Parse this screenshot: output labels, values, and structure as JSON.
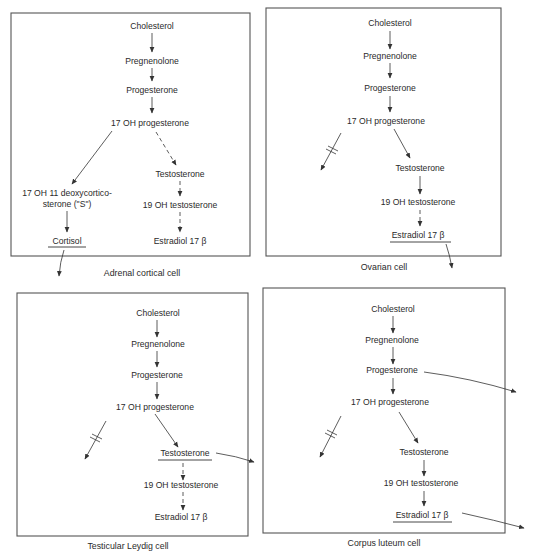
{
  "figure": {
    "panels": [
      {
        "caption": "Adrenal cortical cell",
        "nodes": {
          "cholesterol": "Cholesterol",
          "pregnenolone": "Pregnenolone",
          "progesterone": "Progesterone",
          "oh17_progesterone": "17 OH progesterone",
          "deoxy_line1": "17 OH 11 deoxycortico-",
          "deoxy_line2": "sterone (\"S\")",
          "cortisol": "Cortisol",
          "testosterone": "Testosterone",
          "oh19_testosterone": "19 OH testosterone",
          "estradiol": "Estradiol 17 β"
        },
        "secreted_product": "Cortisol",
        "blocked_branch": false
      },
      {
        "caption": "Ovarian cell",
        "nodes": {
          "cholesterol": "Cholesterol",
          "pregnenolone": "Pregnenolone",
          "progesterone": "Progesterone",
          "oh17_progesterone": "17 OH progesterone",
          "testosterone": "Testosterone",
          "oh19_testosterone": "19 OH testosterone",
          "estradiol": "Estradiol 17 β"
        },
        "secreted_product": "Estradiol 17 β",
        "blocked_branch": true
      },
      {
        "caption": "Testicular Leydig cell",
        "nodes": {
          "cholesterol": "Cholesterol",
          "pregnenolone": "Pregnenolone",
          "progesterone": "Progesterone",
          "oh17_progesterone": "17 OH progesterone",
          "testosterone": "Testosterone",
          "oh19_testosterone": "19 OH testosterone",
          "estradiol": "Estradiol 17 β"
        },
        "secreted_product": "Testosterone",
        "blocked_branch": true
      },
      {
        "caption": "Corpus luteum cell",
        "nodes": {
          "cholesterol": "Cholesterol",
          "pregnenolone": "Pregnenolone",
          "progesterone": "Progesterone",
          "oh17_progesterone": "17 OH progesterone",
          "testosterone": "Testosterone",
          "oh19_testosterone": "19 OH testosterone",
          "estradiol": "Estradiol 17 β"
        },
        "secreted_products": [
          "Progesterone",
          "Estradiol 17 β"
        ],
        "blocked_branch": true
      }
    ]
  }
}
